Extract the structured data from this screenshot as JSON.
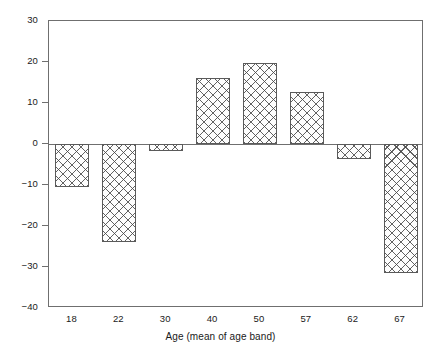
{
  "chart_data": {
    "type": "bar",
    "title": "",
    "subtitle": "",
    "xlabel": "Age (mean of age band)",
    "ylabel": "",
    "categories": [
      "18",
      "22",
      "30",
      "40",
      "50",
      "57",
      "62",
      "67"
    ],
    "values": [
      -10.5,
      -24.0,
      -1.7,
      16.0,
      19.8,
      12.6,
      -3.7,
      -31.5
    ],
    "ylim": [
      -40,
      30
    ],
    "yticks": [
      30,
      20,
      10,
      0,
      -10,
      -20,
      -30,
      -40
    ],
    "ytick_labels": [
      "30",
      "20",
      "10",
      "0",
      "−10",
      "−20",
      "−30",
      "−40"
    ],
    "xticks": [
      "18",
      "22",
      "30",
      "40",
      "50",
      "57",
      "62",
      "67"
    ],
    "grid": false,
    "legend": null,
    "legend_position": "none",
    "bar_fill": "#fdfdfd",
    "bar_edge": "#5a5a5a",
    "bar_pattern": "crosshatch",
    "axis_color": "#6f6f6f",
    "background": "#ffffff",
    "zero_line": 0
  }
}
